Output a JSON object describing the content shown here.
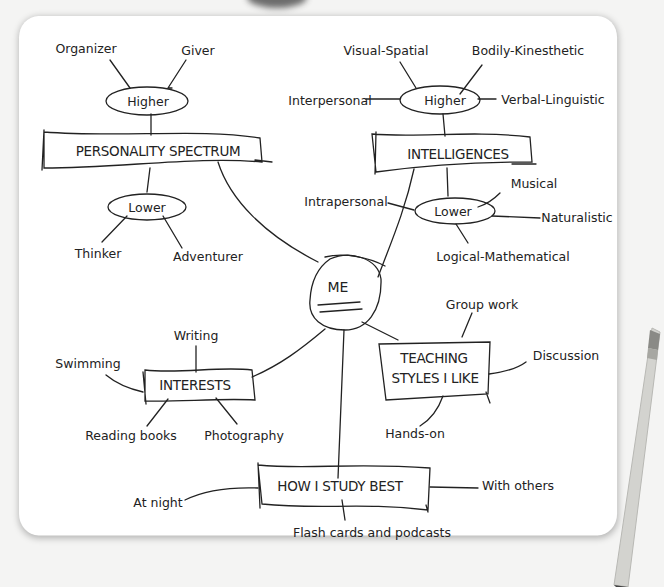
{
  "diagram": {
    "type": "mind-map",
    "center": {
      "label": "ME"
    },
    "branches": [
      {
        "label": "PERSONALITY SPECTRUM",
        "higher": {
          "label": "Higher",
          "children": [
            "Organizer",
            "Giver"
          ]
        },
        "lower": {
          "label": "Lower",
          "children": [
            "Thinker",
            "Adventurer"
          ]
        }
      },
      {
        "label": "INTELLIGENCES",
        "higher": {
          "label": "Higher",
          "children": [
            "Visual-Spatial",
            "Bodily-Kinesthetic",
            "Interpersonal",
            "Verbal-Linguistic"
          ]
        },
        "lower": {
          "label": "Lower",
          "children": [
            "Intrapersonal",
            "Musical",
            "Naturalistic",
            "Logical-Mathematical"
          ]
        }
      },
      {
        "label": "INTERESTS",
        "children": [
          "Writing",
          "Swimming",
          "Reading books",
          "Photography"
        ]
      },
      {
        "label_line1": "TEACHING",
        "label_line2": "STYLES I LIKE",
        "children": [
          "Group work",
          "Discussion",
          "Hands-on"
        ]
      },
      {
        "label": "HOW I STUDY BEST",
        "children": [
          "At night",
          "With others",
          "Flash cards and podcasts"
        ]
      }
    ]
  },
  "colors": {
    "ink": "#222222",
    "paper": "#ffffff",
    "background": "#f3f3f2",
    "pencil": "#c8c8c4"
  }
}
